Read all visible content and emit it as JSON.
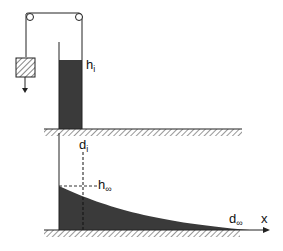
{
  "diagram": {
    "type": "dam-break schematic",
    "top_panel": {
      "labels": {
        "h_symbol": "h",
        "h_sub": "i"
      },
      "elements": [
        "pulley-left",
        "pulley-right",
        "rope",
        "counterweight",
        "gate",
        "reservoir-fluid",
        "ground"
      ]
    },
    "bottom_panel": {
      "labels": {
        "d_i_symbol": "d",
        "d_i_sub": "i",
        "h_inf_symbol": "h",
        "h_inf_sub": "∞",
        "d_inf_symbol": "d",
        "d_inf_sub": "∞",
        "x_axis": "x"
      },
      "elements": [
        "wall",
        "spread-fluid-profile",
        "dashed-vertical-d_i",
        "dashed-horizontal-h_inf",
        "x-axis-arrow",
        "ground"
      ]
    },
    "colors": {
      "fluid": "#3a3a3a",
      "line": "#222222",
      "background": "#ffffff"
    }
  }
}
